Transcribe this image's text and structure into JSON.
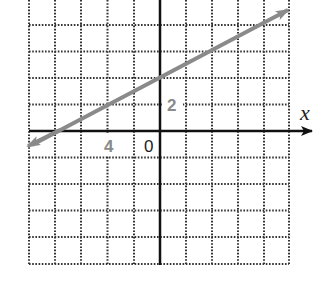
{
  "figure": {
    "type": "coordinate-grid-graph",
    "grid_unit_per_cell": 2,
    "axis_label_x": "x",
    "tick_label_y": "2",
    "tick_label_x": "4",
    "origin_label": "0",
    "line": {
      "equation": "y = 0.5x + 4",
      "slope": 0.5,
      "y_intercept": 4,
      "x_intercept": -8,
      "color": "#8a8a8a",
      "arrows_both_ends": true
    },
    "colors": {
      "grid": "#333333",
      "axis": "#111111",
      "label_gray": "#8a8a8a"
    }
  }
}
